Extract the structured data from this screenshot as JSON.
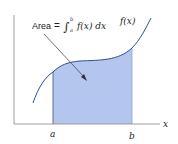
{
  "diagram": {
    "annotation": {
      "label": "Area",
      "equals": "=",
      "integral": "∫",
      "upper_limit": "b",
      "lower_limit": "a",
      "integrand": "f(x) dx"
    },
    "curve_label": "f(x)",
    "x_axis_label": "x",
    "lower_bound_label": "a",
    "upper_bound_label": "b",
    "colors": {
      "curve": "#2f4f8f",
      "shaded_area": "#b5c6ee",
      "shaded_edge": "#3a4f86",
      "axes": "#777777",
      "text": "#222222"
    }
  }
}
